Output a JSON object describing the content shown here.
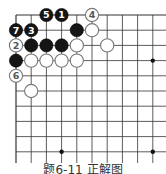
{
  "diagram": {
    "type": "go-board-corner",
    "grid": {
      "origin_x": 16,
      "origin_y": 15,
      "spacing": 15.2,
      "cols": 10,
      "rows": 10,
      "line_color": "#333333",
      "left_edge": true,
      "top_edge": true,
      "right_edge": false,
      "bottom_edge": false
    },
    "stones": [
      {
        "color": "black",
        "col": 2,
        "row": 0,
        "label": "5"
      },
      {
        "color": "black",
        "col": 3,
        "row": 0,
        "label": "1"
      },
      {
        "color": "white",
        "col": 5,
        "row": 0,
        "label": "4"
      },
      {
        "color": "black",
        "col": 0,
        "row": 1,
        "label": "7"
      },
      {
        "color": "black",
        "col": 1,
        "row": 1,
        "label": "3"
      },
      {
        "color": "black",
        "col": 4,
        "row": 1,
        "label": ""
      },
      {
        "color": "white",
        "col": 5,
        "row": 1,
        "label": ""
      },
      {
        "color": "white",
        "col": 0,
        "row": 2,
        "label": "2"
      },
      {
        "color": "black",
        "col": 1,
        "row": 2,
        "label": ""
      },
      {
        "color": "black",
        "col": 2,
        "row": 2,
        "label": ""
      },
      {
        "color": "black",
        "col": 3,
        "row": 2,
        "label": ""
      },
      {
        "color": "white",
        "col": 4,
        "row": 2,
        "label": ""
      },
      {
        "color": "white",
        "col": 6,
        "row": 2,
        "label": ""
      },
      {
        "color": "black",
        "col": 0,
        "row": 3,
        "label": ""
      },
      {
        "color": "white",
        "col": 1,
        "row": 3,
        "label": ""
      },
      {
        "color": "white",
        "col": 2,
        "row": 3,
        "label": ""
      },
      {
        "color": "white",
        "col": 3,
        "row": 3,
        "label": ""
      },
      {
        "color": "white",
        "col": 4,
        "row": 3,
        "label": ""
      },
      {
        "color": "white",
        "col": 0,
        "row": 4,
        "label": "6"
      },
      {
        "color": "white",
        "col": 1,
        "row": 5,
        "label": ""
      }
    ],
    "star_points": [
      {
        "col": 9,
        "row": 3
      },
      {
        "col": 3,
        "row": 9
      },
      {
        "col": 9,
        "row": 9
      }
    ],
    "caption": "题6-11 正解图"
  }
}
